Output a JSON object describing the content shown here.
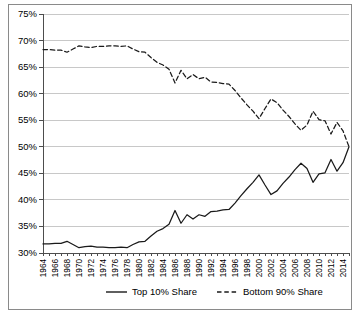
{
  "chart_data": {
    "type": "line",
    "title": "",
    "xlabel": "",
    "ylabel": "",
    "xlim": [
      1964,
      2015
    ],
    "ylim": [
      30,
      75
    ],
    "y_tick_values": [
      30,
      35,
      40,
      45,
      50,
      55,
      60,
      65,
      70,
      75
    ],
    "y_tick_labels": [
      "30%",
      "35%",
      "40%",
      "45%",
      "50%",
      "55%",
      "60%",
      "65%",
      "70%",
      "75%"
    ],
    "grid": true,
    "legend_position": "bottom",
    "x": [
      1964,
      1965,
      1966,
      1967,
      1968,
      1969,
      1970,
      1971,
      1972,
      1973,
      1974,
      1975,
      1976,
      1977,
      1978,
      1979,
      1980,
      1981,
      1982,
      1983,
      1984,
      1985,
      1986,
      1987,
      1988,
      1989,
      1990,
      1991,
      1992,
      1993,
      1994,
      1995,
      1996,
      1997,
      1998,
      1999,
      2000,
      2001,
      2002,
      2003,
      2004,
      2005,
      2006,
      2007,
      2008,
      2009,
      2010,
      2011,
      2012,
      2013,
      2014,
      2015
    ],
    "x_tick_labels": [
      "1964",
      "1966",
      "1968",
      "1970",
      "1972",
      "1974",
      "1976",
      "1978",
      "1980",
      "1982",
      "1984",
      "1986",
      "1988",
      "1990",
      "1992",
      "1994",
      "1996",
      "1998",
      "2000",
      "2002",
      "2004",
      "2006",
      "2008",
      "2010",
      "2012",
      "2014"
    ],
    "x_tick_label_step": 2,
    "series": [
      {
        "name": "Top 10% Share",
        "style": "solid",
        "color": "#1a1a1a",
        "values": [
          31.7,
          31.7,
          31.8,
          31.8,
          32.2,
          31.6,
          31.0,
          31.2,
          31.3,
          31.1,
          31.1,
          31.0,
          31.0,
          31.1,
          31.0,
          31.6,
          32.1,
          32.2,
          33.2,
          34.1,
          34.6,
          35.4,
          38.0,
          35.6,
          37.2,
          36.4,
          37.2,
          36.9,
          37.8,
          37.9,
          38.1,
          38.2,
          39.4,
          40.8,
          42.1,
          43.3,
          44.7,
          42.8,
          41.0,
          41.7,
          43.1,
          44.3,
          45.7,
          46.9,
          45.9,
          43.3,
          44.9,
          45.1,
          47.6,
          45.4,
          47.0,
          50.0
        ]
      },
      {
        "name": "Bottom 90% Share",
        "style": "dashed",
        "color": "#1a1a1a",
        "values": [
          68.3,
          68.3,
          68.2,
          68.2,
          67.8,
          68.4,
          69.0,
          68.8,
          68.7,
          68.9,
          68.9,
          69.0,
          69.0,
          68.9,
          69.0,
          68.4,
          67.9,
          67.8,
          66.8,
          65.9,
          65.4,
          64.6,
          62.0,
          64.4,
          62.8,
          63.6,
          62.8,
          63.1,
          62.2,
          62.1,
          61.9,
          61.8,
          60.6,
          59.2,
          57.9,
          56.7,
          55.3,
          57.2,
          59.0,
          58.3,
          56.9,
          55.7,
          54.3,
          53.1,
          54.1,
          56.7,
          55.1,
          54.9,
          52.4,
          54.6,
          53.0,
          50.0
        ]
      }
    ]
  },
  "legend": {
    "items": [
      {
        "label": "Top 10% Share",
        "style": "solid"
      },
      {
        "label": "Bottom 90% Share",
        "style": "dashed"
      }
    ]
  }
}
